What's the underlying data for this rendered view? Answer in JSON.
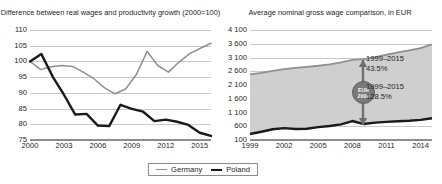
{
  "legend": {
    "position": "bottom-center",
    "items": [
      {
        "label": "Germany",
        "color": "#8f8f8f",
        "icon": "line-swatch-germany"
      },
      {
        "label": "Poland",
        "color": "#1a1a1a",
        "icon": "line-swatch-poland"
      }
    ]
  },
  "annotations": {
    "badge_line1": "EUR",
    "badge_line2": "2000",
    "germany_growth_period": "1999–2015",
    "germany_growth_value": "43.5%",
    "poland_growth_period": "1999–2015",
    "poland_growth_value": "128.5%"
  },
  "chart_data": [
    {
      "type": "line",
      "id": "real-wages-vs-productivity",
      "title": "Difference between real wages and productivity growth (2000=100)",
      "xlabel": "",
      "ylabel": "",
      "grid": true,
      "legend_position": "bottom-center",
      "ylim": [
        75,
        110
      ],
      "yticks": [
        110,
        105,
        100,
        95,
        90,
        85,
        80,
        75
      ],
      "xlim": [
        2000,
        2016
      ],
      "xticks": [
        2000,
        2003,
        2006,
        2009,
        2012,
        2015
      ],
      "x": [
        2000,
        2001,
        2002,
        2003,
        2004,
        2005,
        2006,
        2007,
        2008,
        2009,
        2010,
        2011,
        2012,
        2013,
        2014,
        2015,
        2016
      ],
      "series": [
        {
          "name": "Germany",
          "color": "#8f8f8f",
          "values": [
            100.0,
            97.4,
            98.3,
            98.7,
            98.4,
            96.6,
            94.5,
            91.6,
            89.7,
            91.3,
            95.9,
            103.2,
            98.7,
            96.6,
            99.8,
            102.5,
            104.2,
            105.8
          ]
        },
        {
          "name": "Poland",
          "color": "#1a1a1a",
          "values": [
            100.0,
            102.4,
            95.2,
            89.4,
            83.1,
            83.3,
            79.6,
            79.4,
            86.2,
            84.9,
            84.0,
            81.0,
            81.5,
            80.8,
            79.8,
            77.3,
            76.3
          ]
        }
      ]
    },
    {
      "type": "area",
      "id": "average-nominal-gross-wage",
      "title": "Average nominal gross wage comparison, in EUR",
      "xlabel": "",
      "ylabel": "EUR",
      "grid": true,
      "legend_position": "bottom-center",
      "ylim": [
        100,
        4100
      ],
      "yticks": [
        "4 100",
        "3 600",
        "3 100",
        "2 600",
        "2 100",
        "1 600",
        "1 100",
        "600",
        "100"
      ],
      "ytick_values": [
        4100,
        3600,
        3100,
        2600,
        2100,
        1600,
        1100,
        600,
        100
      ],
      "xlim": [
        1999,
        2015
      ],
      "xticks": [
        1999,
        2002,
        2005,
        2008,
        2011,
        2014
      ],
      "x": [
        1999,
        2000,
        2001,
        2002,
        2003,
        2004,
        2005,
        2006,
        2007,
        2008,
        2009,
        2010,
        2011,
        2012,
        2013,
        2014,
        2015
      ],
      "series": [
        {
          "name": "Germany",
          "color": "#8f8f8f",
          "values": [
            2490,
            2540,
            2610,
            2680,
            2720,
            2760,
            2800,
            2850,
            2920,
            3010,
            3040,
            3110,
            3200,
            3290,
            3360,
            3440,
            3580
          ]
        },
        {
          "name": "Poland",
          "color": "#1a1a1a",
          "values": [
            320,
            400,
            490,
            530,
            500,
            510,
            570,
            610,
            670,
            790,
            680,
            730,
            760,
            780,
            800,
            830,
            890
          ]
        }
      ]
    }
  ]
}
